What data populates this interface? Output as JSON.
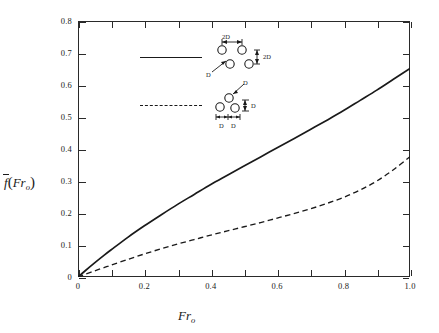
{
  "chart_data": {
    "type": "line",
    "title": "",
    "subtitle": "",
    "xlabel": "Fr",
    "xlabel_sub": "o",
    "ylabel": "f",
    "ylabel_arg": "Fr",
    "ylabel_arg_sub": "o",
    "ylabel_overbar": true,
    "xlim": [
      0,
      1.0
    ],
    "ylim": [
      0,
      0.8
    ],
    "x_tick_step": 0.1,
    "x_label_step": 0.2,
    "y_tick_step": 0.1,
    "grid": false,
    "ticks_direction": "inward",
    "ticks_all_sides": true,
    "x_ticklabels": [
      "0",
      "0.2",
      "0.4",
      "0.6",
      "0.8",
      "1.0"
    ],
    "y_ticklabels": [
      "0",
      "0.1",
      "0.2",
      "0.3",
      "0.4",
      "0.5",
      "0.6",
      "0.7",
      "0.8"
    ],
    "legend_position": "upper-center",
    "series": [
      {
        "name": "2D-spacing arrangement",
        "style": "solid",
        "color": "#1a1a1a",
        "x": [
          0.0,
          0.02,
          0.05,
          0.08,
          0.1,
          0.15,
          0.2,
          0.25,
          0.3,
          0.35,
          0.4,
          0.45,
          0.5,
          0.55,
          0.6,
          0.65,
          0.7,
          0.75,
          0.8,
          0.85,
          0.9,
          0.95,
          1.0
        ],
        "y": [
          0.0,
          0.018,
          0.044,
          0.069,
          0.085,
          0.124,
          0.16,
          0.194,
          0.227,
          0.258,
          0.289,
          0.318,
          0.347,
          0.375,
          0.404,
          0.432,
          0.461,
          0.49,
          0.52,
          0.552,
          0.584,
          0.618,
          0.652
        ]
      },
      {
        "name": "D-spacing arrangement",
        "style": "dashed",
        "color": "#1a1a1a",
        "x": [
          0.0,
          0.02,
          0.05,
          0.08,
          0.1,
          0.15,
          0.2,
          0.25,
          0.3,
          0.35,
          0.4,
          0.45,
          0.5,
          0.55,
          0.6,
          0.65,
          0.7,
          0.75,
          0.8,
          0.85,
          0.9,
          0.95,
          1.0
        ],
        "y": [
          0.0,
          0.008,
          0.019,
          0.03,
          0.037,
          0.055,
          0.072,
          0.088,
          0.103,
          0.117,
          0.131,
          0.144,
          0.157,
          0.17,
          0.184,
          0.198,
          0.213,
          0.23,
          0.249,
          0.272,
          0.3,
          0.335,
          0.376
        ]
      }
    ]
  },
  "legend": {
    "rows": [
      {
        "sample_style": "solid",
        "sketch_labels": [
          "2D",
          "2D",
          "D"
        ],
        "horizontal_label": "2D",
        "vertical_label": "2D",
        "offset_label": "D"
      },
      {
        "sample_style": "dashed",
        "sketch_labels": [
          "D",
          "D",
          "D",
          "D"
        ],
        "horizontal_labels": [
          "D",
          "D"
        ],
        "vertical_label": "D",
        "offset_label": "D"
      }
    ]
  }
}
